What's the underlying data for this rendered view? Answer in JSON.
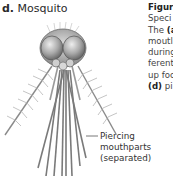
{
  "figure": {
    "panel_letter": "d.",
    "panel_title": "Mosquito",
    "callout_lines": [
      "Piercing",
      "mouthparts",
      "(separated)"
    ]
  },
  "caption": {
    "lines": [
      {
        "text": "Figur",
        "bold": true
      },
      {
        "text": "Speci",
        "bold": false
      },
      {
        "pre": "The ",
        "bold_part": "(a",
        "post": ""
      },
      {
        "text": "moutl",
        "bold": false
      },
      {
        "text": "during",
        "bold": false
      },
      {
        "text": "ferent",
        "bold": false
      },
      {
        "text": "up foo",
        "bold": false
      },
      {
        "pre": "",
        "bold_part": "(d)",
        "post": " pi"
      }
    ]
  }
}
